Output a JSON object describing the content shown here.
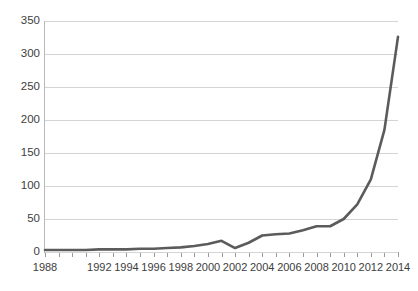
{
  "chart_data": {
    "type": "line",
    "title": "",
    "subtitle": "",
    "xlabel": "",
    "ylabel": "",
    "x": [
      1988,
      1989,
      1990,
      1991,
      1992,
      1993,
      1994,
      1995,
      1996,
      1997,
      1998,
      1999,
      2000,
      2001,
      2002,
      2003,
      2004,
      2005,
      2006,
      2007,
      2008,
      2009,
      2010,
      2011,
      2012,
      2013,
      2014
    ],
    "values": [
      3,
      3,
      3,
      3,
      4,
      4,
      4,
      5,
      5,
      6,
      7,
      9,
      12,
      17,
      6,
      14,
      25,
      27,
      28,
      33,
      39,
      39,
      50,
      72,
      110,
      185,
      326
    ],
    "series": [
      {
        "name": "series-1",
        "color": "#5b5b5b",
        "values": [
          3,
          3,
          3,
          3,
          4,
          4,
          4,
          5,
          5,
          6,
          7,
          9,
          12,
          17,
          6,
          14,
          25,
          27,
          28,
          33,
          39,
          39,
          50,
          72,
          110,
          185,
          326
        ]
      }
    ],
    "x_tick_labels": [
      "1988",
      "1992",
      "1994",
      "1996",
      "1998",
      "2000",
      "2002",
      "2004",
      "2006",
      "2008",
      "2010",
      "2012",
      "2014"
    ],
    "x_tick_values": [
      1988,
      1992,
      1994,
      1996,
      1998,
      2000,
      2002,
      2004,
      2006,
      2008,
      2010,
      2012,
      2014
    ],
    "y_tick_labels": [
      "0",
      "50",
      "100",
      "150",
      "200",
      "250",
      "300",
      "350"
    ],
    "y_ticks": [
      0,
      50,
      100,
      150,
      200,
      250,
      300,
      350
    ],
    "xlim": [
      1988,
      2014
    ],
    "ylim": [
      0,
      350
    ],
    "grid": "horizontal",
    "legend": "none",
    "annotations": []
  },
  "colors": {
    "line": "#5b5b5b",
    "grid": "#d4d4d4",
    "axis": "#b0b0b0",
    "tick_text": "#3d3d3d",
    "background": "#ffffff"
  }
}
